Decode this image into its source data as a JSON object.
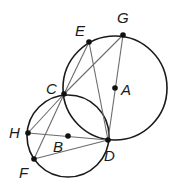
{
  "figure": {
    "circles": [
      {
        "name": "circle-A",
        "center": "A",
        "through": [
          "E",
          "G",
          "C",
          "D"
        ]
      },
      {
        "name": "circle-B",
        "center": "B",
        "through": [
          "C",
          "D",
          "H",
          "F"
        ]
      }
    ],
    "points": {
      "A": "A",
      "B": "B",
      "C": "C",
      "D": "D",
      "E": "E",
      "F": "F",
      "G": "G",
      "H": "H"
    },
    "segments": [
      [
        "C",
        "E"
      ],
      [
        "C",
        "G"
      ],
      [
        "E",
        "D"
      ],
      [
        "G",
        "D"
      ],
      [
        "C",
        "H"
      ],
      [
        "C",
        "F"
      ],
      [
        "H",
        "D"
      ],
      [
        "F",
        "D"
      ]
    ],
    "colors": {
      "circle_stroke": "#1a1a1a",
      "segment_stroke": "#6b6b6b",
      "point_fill": "#111111",
      "background": "#ffffff"
    }
  }
}
